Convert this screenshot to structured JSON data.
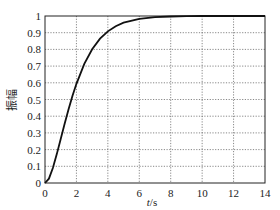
{
  "chart_data": {
    "type": "line",
    "title": "",
    "xlabel": "t/s",
    "xlabel_italic_part": "t",
    "xlabel_unit_part": "/s",
    "ylabel": "振幅",
    "xlim": [
      0,
      14
    ],
    "ylim": [
      0,
      1
    ],
    "grid": true,
    "grid_style": "dotted",
    "legend": null,
    "x_ticks": [
      0,
      2,
      4,
      6,
      8,
      10,
      12,
      14
    ],
    "y_ticks": [
      0,
      0.1,
      0.2,
      0.3,
      0.4,
      0.5,
      0.6,
      0.7,
      0.8,
      0.9,
      1
    ],
    "x_tick_labels": [
      "0",
      "2",
      "4",
      "6",
      "8",
      "10",
      "12",
      "14"
    ],
    "y_tick_labels": [
      "0",
      "0.1",
      "0.2",
      "0.3",
      "0.4",
      "0.5",
      "0.6",
      "0.7",
      "0.8",
      "0.9",
      "1"
    ],
    "series": [
      {
        "name": "step response",
        "color": "#111111",
        "x": [
          0,
          0.25,
          0.5,
          0.75,
          1,
          1.25,
          1.5,
          1.75,
          2,
          2.5,
          3,
          3.5,
          4,
          4.5,
          5,
          6,
          7,
          8,
          9,
          10,
          11,
          12,
          13,
          14
        ],
        "y": [
          0,
          0.026,
          0.09,
          0.173,
          0.264,
          0.355,
          0.442,
          0.522,
          0.594,
          0.713,
          0.801,
          0.864,
          0.908,
          0.939,
          0.96,
          0.983,
          0.993,
          0.997,
          0.999,
          1.0,
          1.0,
          1.0,
          1.0,
          1.0
        ]
      }
    ]
  }
}
